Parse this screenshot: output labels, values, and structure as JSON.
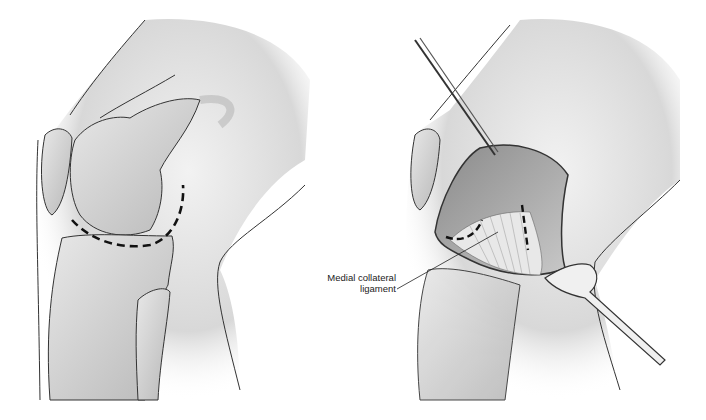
{
  "figure": {
    "panels": [
      {
        "id": "left",
        "description": "Lateral view of flexed knee with dashed incision line around femoral condyle"
      },
      {
        "id": "right",
        "description": "Exposed joint with retractor and forceps; dashed lines on ligament"
      }
    ],
    "labels": [
      {
        "line1": "Medial collateral",
        "line2": "ligament"
      }
    ],
    "colors": {
      "outline": "#333333",
      "skin": "#e6e6e6",
      "shade": "#bdbdbd",
      "bone": "#d9d9d9",
      "dash": "#111111"
    }
  }
}
